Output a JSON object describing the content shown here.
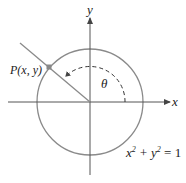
{
  "diagram": {
    "axis_x_label": "x",
    "axis_y_label": "y",
    "point_label": "P(x, y)",
    "angle_label": "θ",
    "equation": {
      "lhs_a": "x",
      "lhs_b": " + y",
      "rhs": " = 1",
      "exp": "2"
    },
    "colors": {
      "circle": "#8a8a8a",
      "axes": "#555555",
      "point": "#888888",
      "text": "#222222"
    }
  }
}
